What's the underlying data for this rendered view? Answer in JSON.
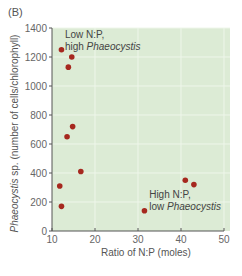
{
  "panel_label": "(B)",
  "chart_data": {
    "type": "scatter",
    "title": "",
    "xlabel": "Ratio of N:P (moles)",
    "ylabel_italic": "Phaeocystis",
    "ylabel_rest": " sp. (number of cells/chlorophyll)",
    "xlim": [
      10,
      50
    ],
    "ylim": [
      0,
      1400
    ],
    "xticks": [
      10,
      20,
      30,
      40,
      50
    ],
    "yticks": [
      0,
      200,
      400,
      600,
      800,
      1000,
      1200,
      1400
    ],
    "grid": true,
    "colors": {
      "background": "#dcebd5",
      "grid": "#eef6ea",
      "point": "#a6281f",
      "axis": "#555555"
    },
    "series": [
      {
        "name": "samples",
        "points": [
          {
            "x": 12.2,
            "y": 1250
          },
          {
            "x": 14.6,
            "y": 1200
          },
          {
            "x": 13.8,
            "y": 1130
          },
          {
            "x": 14.8,
            "y": 720
          },
          {
            "x": 13.5,
            "y": 650
          },
          {
            "x": 16.7,
            "y": 410
          },
          {
            "x": 11.8,
            "y": 310
          },
          {
            "x": 12.2,
            "y": 170
          },
          {
            "x": 41.0,
            "y": 350
          },
          {
            "x": 43.0,
            "y": 320
          },
          {
            "x": 31.5,
            "y": 140
          }
        ]
      }
    ],
    "annotations": [
      {
        "line1": "Low N:P,",
        "line2_plain": "high ",
        "line2_italic": "Phaeocystis",
        "anchor_x": 13,
        "anchor_y": 1330
      },
      {
        "line1": "High N:P,",
        "line2_plain": "low ",
        "line2_italic": "Phaeocystis",
        "anchor_x": 32.6,
        "anchor_y": 230
      }
    ]
  }
}
